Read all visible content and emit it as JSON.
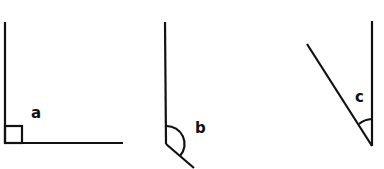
{
  "diagram": {
    "type": "angle-types",
    "stroke_color": "#111111",
    "angles": [
      {
        "id": "a",
        "label": "a",
        "kind": "right",
        "marker": "square"
      },
      {
        "id": "b",
        "label": "b",
        "kind": "obtuse",
        "marker": "arc"
      },
      {
        "id": "c",
        "label": "c",
        "kind": "acute",
        "marker": "arc"
      }
    ]
  }
}
